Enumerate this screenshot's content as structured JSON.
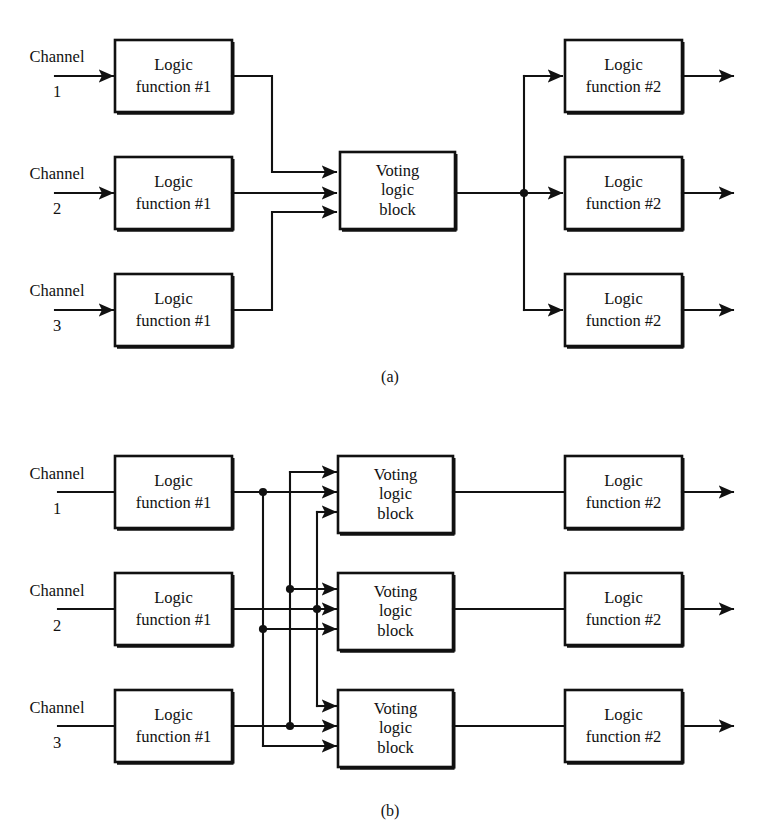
{
  "figure": {
    "background_color": "#ffffff",
    "line_color": "#111111",
    "panels": [
      {
        "id": "panel-a",
        "caption": "(a)",
        "caption_x": 390,
        "caption_y": 378,
        "description": "Single voting logic block shared by three channels, fanning out to three logic function #2 blocks",
        "channels": [
          {
            "name_label": "Channel",
            "number_label": "1"
          },
          {
            "name_label": "Channel",
            "number_label": "2"
          },
          {
            "name_label": "Channel",
            "number_label": "3"
          }
        ],
        "input_blocks": [
          {
            "line1": "Logic",
            "line2": "function #1"
          },
          {
            "line1": "Logic",
            "line2": "function #1"
          },
          {
            "line1": "Logic",
            "line2": "function #1"
          }
        ],
        "voting_blocks": [
          {
            "line1": "Voting",
            "line2": "logic",
            "line3": "block"
          }
        ],
        "output_blocks": [
          {
            "line1": "Logic",
            "line2": "function #2"
          },
          {
            "line1": "Logic",
            "line2": "function #2"
          },
          {
            "line1": "Logic",
            "line2": "function #2"
          }
        ]
      },
      {
        "id": "panel-b",
        "caption": "(b)",
        "caption_x": 390,
        "caption_y": 812,
        "description": "Three voting logic blocks, each receiving all three channel outputs via a cross-connected bus",
        "channels": [
          {
            "name_label": "Channel",
            "number_label": "1"
          },
          {
            "name_label": "Channel",
            "number_label": "2"
          },
          {
            "name_label": "Channel",
            "number_label": "3"
          }
        ],
        "input_blocks": [
          {
            "line1": "Logic",
            "line2": "function #1"
          },
          {
            "line1": "Logic",
            "line2": "function #1"
          },
          {
            "line1": "Logic",
            "line2": "function #1"
          }
        ],
        "voting_blocks": [
          {
            "line1": "Voting",
            "line2": "logic",
            "line3": "block"
          },
          {
            "line1": "Voting",
            "line2": "logic",
            "line3": "block"
          },
          {
            "line1": "Voting",
            "line2": "logic",
            "line3": "block"
          }
        ],
        "output_blocks": [
          {
            "line1": "Logic",
            "line2": "function #2"
          },
          {
            "line1": "Logic",
            "line2": "function #2"
          },
          {
            "line1": "Logic",
            "line2": "function #2"
          }
        ]
      }
    ]
  }
}
